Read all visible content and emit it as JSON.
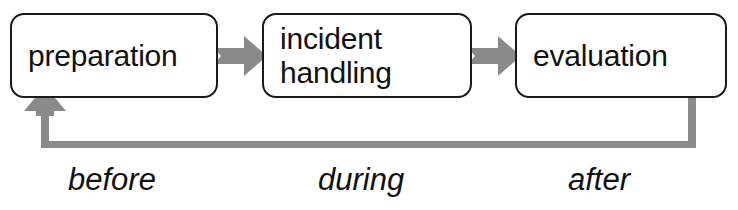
{
  "diagram": {
    "colors": {
      "box_border": "#1a1a1a",
      "box_fill": "#ffffff",
      "text": "#111111",
      "arrow_gray": "#8a8a8a",
      "background": "#ffffff"
    },
    "nodes": [
      {
        "id": "preparation",
        "label": "preparation"
      },
      {
        "id": "incident-handling",
        "label": "incident\nhandling"
      },
      {
        "id": "evaluation",
        "label": "evaluation"
      }
    ],
    "phase_labels": [
      {
        "id": "before",
        "label": "before"
      },
      {
        "id": "during",
        "label": "during"
      },
      {
        "id": "after",
        "label": "after"
      }
    ],
    "connectors": [
      {
        "id": "prep-to-incident",
        "from": "preparation",
        "to": "incident-handling",
        "style": "gray-chevron-arrow-right"
      },
      {
        "id": "incident-to-eval",
        "from": "incident-handling",
        "to": "evaluation",
        "style": "gray-chevron-arrow-right"
      },
      {
        "id": "eval-to-prep-feedback",
        "from": "evaluation",
        "to": "preparation",
        "style": "gray-feedback-loop-arrow-up"
      }
    ]
  }
}
